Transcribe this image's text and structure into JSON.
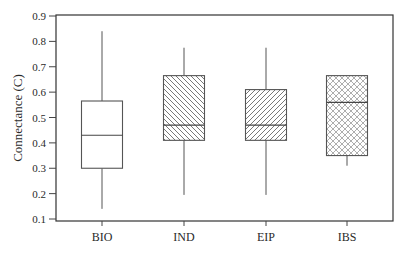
{
  "chart_data": {
    "type": "boxplot",
    "title": "",
    "xlabel": "",
    "ylabel": "Connectance (C)",
    "ylim": [
      0.1,
      0.9
    ],
    "yticks": [
      0.1,
      0.2,
      0.3,
      0.4,
      0.5,
      0.6,
      0.7,
      0.8,
      0.9
    ],
    "ytick_labels": [
      "0.1",
      "0.2",
      "0.3",
      "0.4",
      "0.5",
      "0.6",
      "0.7",
      "0.8",
      "0.9"
    ],
    "grid": false,
    "legend": null,
    "categories": [
      "BIO",
      "IND",
      "EIP",
      "IBS"
    ],
    "boxes": [
      {
        "name": "BIO",
        "whisker_low": 0.14,
        "q1": 0.3,
        "median": 0.43,
        "q3": 0.565,
        "whisker_high": 0.84,
        "fill": "none"
      },
      {
        "name": "IND",
        "whisker_low": 0.195,
        "q1": 0.41,
        "median": 0.47,
        "q3": 0.665,
        "whisker_high": 0.775,
        "fill": "hatch-backslash"
      },
      {
        "name": "EIP",
        "whisker_low": 0.195,
        "q1": 0.41,
        "median": 0.47,
        "q3": 0.61,
        "whisker_high": 0.775,
        "fill": "hatch-forwardslash"
      },
      {
        "name": "IBS",
        "whisker_low": 0.31,
        "q1": 0.35,
        "median": 0.56,
        "q3": 0.665,
        "whisker_high": 0.665,
        "fill": "hatch-crosshatch"
      }
    ],
    "colors": {
      "line": "#555555",
      "axis": "#333333",
      "text": "#2a2a2a"
    }
  }
}
